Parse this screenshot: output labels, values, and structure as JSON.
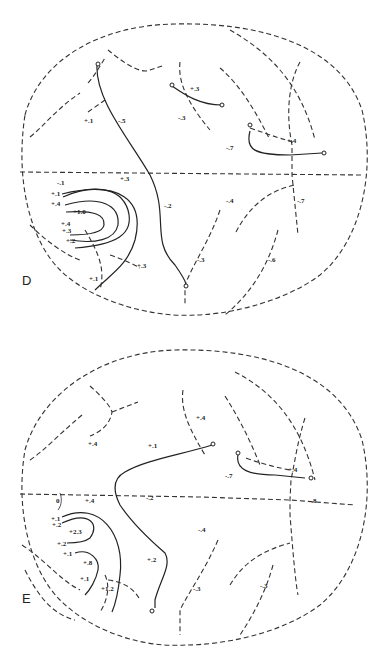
{
  "figure": {
    "panels": [
      {
        "id": "D",
        "letter": "D",
        "labels": [
          "+.1",
          "-.5",
          "+.3",
          "-.3",
          "-.7",
          "+.4",
          "-.1",
          "+.3",
          "+.1",
          "+.4",
          "+1.0",
          "+.4",
          "+.3",
          "+.2",
          "-.2",
          "-.4",
          "-.7",
          "+.3",
          "-.3",
          "+.1",
          "-.6"
        ]
      },
      {
        "id": "E",
        "letter": "E",
        "labels": [
          "+.4",
          "+.1",
          "+.4",
          "-.7",
          "+.4",
          "0",
          "+.4",
          "-.2",
          "-.8",
          "+.1",
          "+.2",
          "+2.3",
          "+.2",
          "+.1",
          "+.8",
          "+.1",
          "+1.2",
          "+.2",
          "-.4",
          "-.3",
          "-.3"
        ]
      }
    ]
  }
}
